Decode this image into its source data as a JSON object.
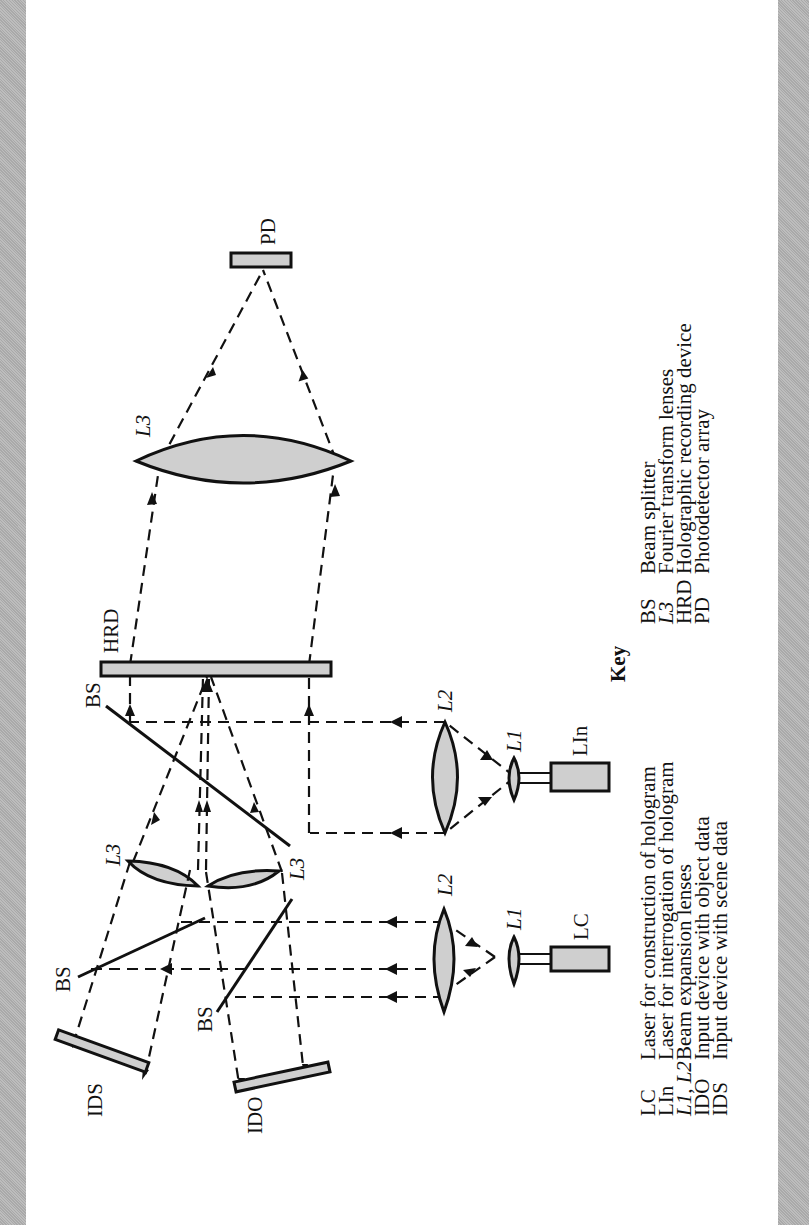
{
  "diagram": {
    "orientation": "rotated 90° counter-clockwise",
    "components": {
      "pd": "PD",
      "l3_top": "L3",
      "hrd": "HRD",
      "bs_center": "BS",
      "l2_right": "L2",
      "l1_right": "L1",
      "lin": "LIn",
      "l3_left": "L3",
      "l3_right": "L3",
      "bs_upper": "BS",
      "bs_lower": "BS",
      "l2_left": "L2",
      "l1_left": "L1",
      "lc": "LC",
      "ids": "IDS",
      "ido": "IDO"
    },
    "colors": {
      "fill": "#cfcfcf",
      "stroke": "#111111",
      "edge": "#b3b3b3",
      "page": "#ffffff"
    }
  },
  "key": {
    "title": "Key",
    "left": [
      {
        "abbr": "LC",
        "desc": "Laser for construction of hologram"
      },
      {
        "abbr": "LIn",
        "desc": "Laser for interrogation of hologram"
      },
      {
        "abbr": "L1, L2",
        "desc": "Beam expansion lenses"
      },
      {
        "abbr": "IDO",
        "desc": "Input device with object data"
      },
      {
        "abbr": "IDS",
        "desc": "Input device with scene data"
      }
    ],
    "right": [
      {
        "abbr": "BS",
        "desc": "Beam splitter"
      },
      {
        "abbr": "L3",
        "desc": "Fourier transform lenses"
      },
      {
        "abbr": "HRD",
        "desc": "Holographic recording device"
      },
      {
        "abbr": "PD",
        "desc": "Photodetector array"
      }
    ]
  }
}
